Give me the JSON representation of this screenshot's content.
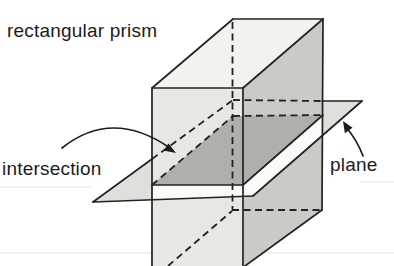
{
  "figure": {
    "labels": {
      "prism": "rectangular prism",
      "intersection": "intersection",
      "plane": "plane"
    },
    "colors": {
      "background": "#ffffff",
      "line": "#222222",
      "top_face": "#f3f2ef",
      "front_face": "#e8e7e4",
      "right_face": "#cbcac7",
      "cross_section": "#b0afac",
      "plane_fill": "#e0dfdc",
      "plane_front_strip": "#fafaf8",
      "label_color": "#1b1b1b"
    }
  }
}
